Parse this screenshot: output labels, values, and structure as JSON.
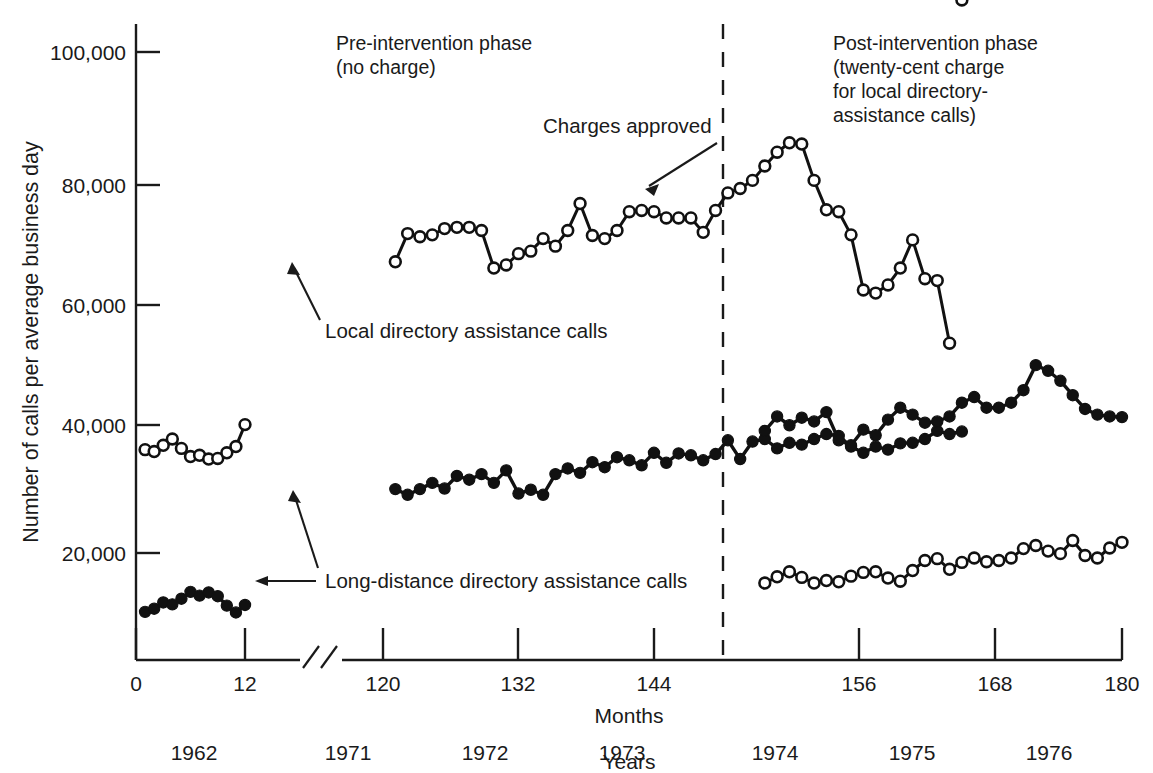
{
  "axes": {
    "y_label": "Number of calls per average business day",
    "y_ticks": [
      "100,000",
      "80,000",
      "60,000",
      "40,000",
      "20,000"
    ],
    "y_tick_values": [
      100000,
      80000,
      60000,
      40000,
      20000
    ],
    "x_label": "Months",
    "x_ticks": [
      "0",
      "12",
      "120",
      "132",
      "144",
      "156",
      "168",
      "180"
    ],
    "x_tick_values": [
      0,
      12,
      120,
      132,
      144,
      156,
      168,
      180
    ],
    "secondary_x_label": "Years",
    "year_labels": [
      "1962",
      "1971",
      "1972",
      "1973",
      "1974",
      "1975",
      "1976"
    ],
    "axis_break": true
  },
  "annotations": {
    "pre_phase": [
      "Pre-intervention phase",
      "(no charge)"
    ],
    "post_phase": [
      "Post-intervention phase",
      "(twenty-cent charge",
      "for local directory-",
      "assistance calls)"
    ],
    "charges_approved": "Charges approved",
    "local_series_label": "Local directory assistance calls",
    "longdistance_series_label": "Long-distance directory assistance calls"
  },
  "colors": {
    "ink": "#1a1a1a",
    "line": "#111111",
    "open_marker_fill": "#ffffff",
    "filled_marker": "#111111",
    "background": "#ffffff"
  },
  "chart_data": {
    "type": "line",
    "title": "",
    "xlabel": "Months",
    "ylabel": "Number of calls per average business day",
    "ylim": [
      0,
      106000
    ],
    "grid": false,
    "legend": "inline-annotations",
    "intervention_month": 148,
    "series": [
      {
        "name": "Local directory assistance calls",
        "marker": "open-circle",
        "segments": [
          {
            "phase": "1962 baseline",
            "x": [
              1,
              2,
              3,
              4,
              5,
              6,
              7,
              8,
              9,
              10,
              11,
              12
            ],
            "y": [
              36500,
              36200,
              37200,
              38200,
              36700,
              35400,
              35600,
              35000,
              35100,
              36000,
              37000,
              40500
            ]
          },
          {
            "phase": "pre-intervention",
            "x": [
              121,
              122,
              123,
              124,
              125,
              126,
              127,
              128,
              129,
              130,
              131,
              132,
              133,
              134,
              135,
              136,
              137,
              138,
              139,
              140,
              141,
              142,
              143,
              144,
              145,
              146,
              147,
              148,
              149,
              150,
              151,
              152,
              153,
              154,
              155,
              156,
              157,
              158,
              159,
              160,
              161,
              162,
              163,
              164,
              165,
              166,
              167
            ],
            "y": [
              66500,
              71000,
              70500,
              70800,
              71800,
              72000,
              72000,
              71500,
              65500,
              66000,
              67800,
              68200,
              70200,
              69000,
              71500,
              75800,
              70700,
              70200,
              71500,
              74500,
              74700,
              74500,
              73500,
              73500,
              73500,
              71200,
              74700,
              77500,
              78200,
              79500,
              81800,
              84000,
              85500,
              85300,
              79500,
              74800,
              74500,
              70800,
              62000,
              61500,
              62800,
              65500,
              70000,
              63800,
              63500,
              53500
            ]
          }
        ],
        "post_segment": {
          "phase": "post-intervention",
          "x": [
            151,
            152,
            153,
            154,
            155,
            156,
            157,
            158,
            159,
            160,
            161,
            162,
            163,
            164,
            165,
            166,
            167,
            168,
            169,
            170,
            171,
            172,
            173,
            174,
            175,
            176,
            177,
            178,
            179,
            180
          ],
          "y": [
            15200,
            16200,
            17000,
            16100,
            15200,
            15600,
            15400,
            16300,
            16900,
            17000,
            16000,
            15500,
            17200,
            18800,
            19100,
            17400,
            18500,
            19200,
            18600,
            18800,
            19200,
            20700,
            21200,
            20300,
            19900,
            22000,
            19600,
            19200,
            20800,
            21700
          ]
        }
      },
      {
        "name": "Long-distance directory assistance calls",
        "marker": "filled-circle",
        "segments": [
          {
            "phase": "1962 baseline",
            "x": [
              1,
              2,
              3,
              4,
              5,
              6,
              7,
              8,
              9,
              10,
              11,
              12
            ],
            "y": [
              10600,
              11100,
              12100,
              11800,
              12700,
              13800,
              13200,
              13700,
              13100,
              11600,
              10500,
              11700
            ]
          },
          {
            "phase": "pre-intervention",
            "x": [
              121,
              122,
              123,
              124,
              125,
              126,
              127,
              128,
              129,
              130,
              131,
              132,
              133,
              134,
              135,
              136,
              137,
              138,
              139,
              140,
              141,
              142,
              143,
              144,
              145,
              146,
              147,
              148,
              149,
              150,
              151,
              152,
              153,
              154,
              155,
              156,
              157,
              158,
              159,
              160,
              161,
              162,
              163,
              164,
              165,
              166,
              167
            ],
            "y": [
              30200,
              29300,
              30200,
              31200,
              30300,
              32300,
              31700,
              32600,
              31200,
              33200,
              29500,
              30100,
              29300,
              32600,
              33500,
              32800,
              34500,
              33700,
              35300,
              34800,
              34000,
              36000,
              34400,
              35900,
              35600,
              34800,
              35800,
              38000,
              35000,
              37800,
              38200,
              36700,
              37600,
              37300,
              38200,
              39000,
              38700,
              37000,
              36000,
              37000,
              36500,
              37500,
              37600,
              38200,
              39500,
              39000,
              39400
            ]
          }
        ],
        "post_segment": {
          "phase": "post-intervention",
          "x": [
            151,
            152,
            153,
            154,
            155,
            156,
            157,
            158,
            159,
            160,
            161,
            162,
            163,
            164,
            165,
            166,
            167,
            168,
            169,
            170,
            171,
            172,
            173,
            174,
            175,
            176,
            177,
            178,
            179,
            180
          ],
          "y": [
            39500,
            41800,
            40400,
            41600,
            41000,
            42500,
            38000,
            37200,
            39700,
            38800,
            41300,
            43200,
            42100,
            40800,
            41000,
            41800,
            44000,
            44900,
            43200,
            43200,
            44000,
            46000,
            50000,
            49100,
            47500,
            45200,
            43000,
            42100,
            41800,
            41700
          ]
        }
      }
    ]
  }
}
